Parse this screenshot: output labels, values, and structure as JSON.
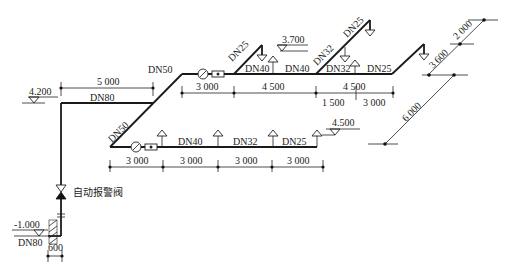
{
  "diagram": {
    "type": "fire sprinkler piping isometric system diagram",
    "pipe_sizes": {
      "riser": "DN80",
      "riser_bottom": "DN80",
      "top_horizontal": "DN80",
      "diagonal_lower": "DN50",
      "upper_branch_start": "DN50",
      "upper_riser_1": "DN25",
      "upper_seg_1": "DN40",
      "upper_seg_2": "DN40",
      "upper_riser_2": "DN32",
      "upper_riser_2_top": "DN25",
      "upper_seg_3": "DN32",
      "upper_seg_4": "DN25",
      "lower_seg_1": "DN40",
      "lower_seg_2": "DN32",
      "lower_seg_3": "DN25"
    },
    "elevations": {
      "top_main": "4.200",
      "upper_branch": "3.700",
      "lower_branch": "4.500",
      "bottom": "-1.000"
    },
    "dimensions": {
      "top_horizontal": "5 000",
      "upper": [
        "3 000",
        "4 500",
        "4 500"
      ],
      "upper_sub": [
        "1 500",
        "3 000"
      ],
      "lower": [
        "3 000",
        "3 000",
        "3 000",
        "3 000"
      ],
      "right_a": "3 600",
      "right_b": "2 000",
      "right_c": "6 000",
      "bottom": "600"
    },
    "valve_label": "自动报警阀"
  }
}
